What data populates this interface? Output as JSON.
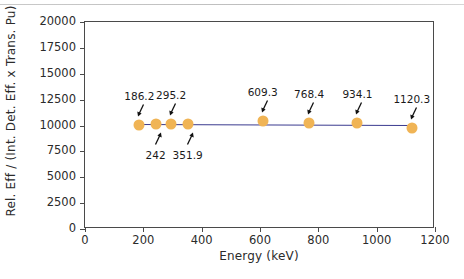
{
  "chart_data": {
    "type": "scatter",
    "title": "",
    "xlabel": "Energy (keV)",
    "ylabel": "Rel. Eff / (Int. Det. Eff. x Trans. Pu)",
    "xlim": [
      0,
      1200
    ],
    "ylim": [
      0,
      20000
    ],
    "xticks": [
      0,
      200,
      400,
      600,
      800,
      1000,
      1200
    ],
    "xticklabels": [
      "0",
      "200",
      "400",
      "600",
      "800",
      "1000",
      "1200"
    ],
    "yticks": [
      0,
      2500,
      5000,
      7500,
      10000,
      12500,
      15000,
      17500,
      20000
    ],
    "yticklabels": [
      "0",
      "2500",
      "5000",
      "7500",
      "10000",
      "12500",
      "15000",
      "17500",
      "20000"
    ],
    "grid": false,
    "legend": "none",
    "marker_color": "#f0b455",
    "line_color": "#3b3b8f",
    "points": [
      {
        "label": "186.2",
        "x": 186.2,
        "y": 10050,
        "annotation_side": "above"
      },
      {
        "label": "242",
        "x": 242.0,
        "y": 10150,
        "annotation_side": "below"
      },
      {
        "label": "295.2",
        "x": 295.2,
        "y": 10100,
        "annotation_side": "above"
      },
      {
        "label": "351.9",
        "x": 351.9,
        "y": 10150,
        "annotation_side": "below"
      },
      {
        "label": "609.3",
        "x": 609.3,
        "y": 10400,
        "annotation_side": "above"
      },
      {
        "label": "768.4",
        "x": 768.4,
        "y": 10200,
        "annotation_side": "above"
      },
      {
        "label": "934.1",
        "x": 934.1,
        "y": 10250,
        "annotation_side": "above"
      },
      {
        "label": "1120.3",
        "x": 1120.3,
        "y": 9800,
        "annotation_side": "above"
      }
    ],
    "fit_line": {
      "x_start": 186.2,
      "y_start": 10120,
      "x_end": 1120.3,
      "y_end": 10020
    }
  }
}
